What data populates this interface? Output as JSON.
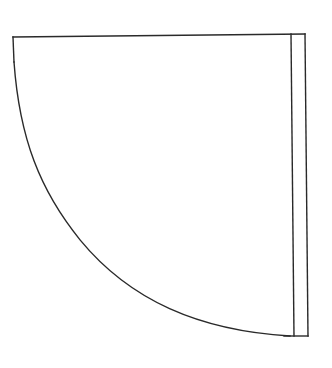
{
  "diagram": {
    "type": "door-swing-symbol",
    "stroke_color": "#2a2a2a",
    "background_color": "#ffffff",
    "stroke_width": 1.4,
    "elements": {
      "top_edge": {
        "x1": 13,
        "y1": 37,
        "x2": 305,
        "y2": 34
      },
      "left_edge": {
        "x1": 13,
        "y1": 37,
        "x2": 14,
        "y2": 62
      },
      "swing_arc": {
        "start": [
          14,
          62
        ],
        "end": [
          290,
          336
        ]
      },
      "door_leaf": {
        "inner_line": {
          "x1": 291,
          "y1": 34,
          "x2": 294,
          "y2": 336
        },
        "outer_line": {
          "x1": 305,
          "y1": 34,
          "x2": 308,
          "y2": 336
        },
        "bottom_line": {
          "x1": 284,
          "y1": 336,
          "x2": 308,
          "y2": 336
        }
      }
    }
  }
}
